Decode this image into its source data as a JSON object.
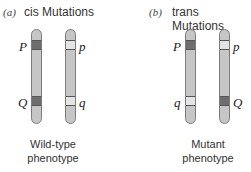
{
  "panels": [
    {
      "tag": "(a)",
      "title": "cis Mutations",
      "caption_line1": "Wild-type",
      "caption_line2": "phenotype",
      "chromosomes": [
        {
          "upper_label": "P",
          "upper_band": "dark",
          "lower_label": "Q",
          "lower_band": "dark"
        },
        {
          "upper_label": "p",
          "upper_band": "light",
          "lower_label": "q",
          "lower_band": "light"
        }
      ]
    },
    {
      "tag": "(b)",
      "title": "trans Mutations",
      "caption_line1": "Mutant",
      "caption_line2": "phenotype",
      "chromosomes": [
        {
          "upper_label": "P",
          "upper_band": "dark",
          "lower_label": "q",
          "lower_band": "light"
        },
        {
          "upper_label": "p",
          "upper_band": "light",
          "lower_label": "Q",
          "lower_band": "dark"
        }
      ]
    }
  ],
  "colors": {
    "chromosome_body": "#c6c6c6",
    "chromosome_outline": "#7c7c7c",
    "dominant_band": "#6e6e6e",
    "recessive_band": "#e4e4e4"
  }
}
